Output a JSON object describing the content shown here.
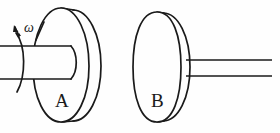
{
  "figure": {
    "background_color": "#fefefe",
    "line_color": "#1a1a1a",
    "width": 280,
    "height": 133
  },
  "labels": {
    "disk_a": "A",
    "disk_b": "B",
    "omega": "ω"
  },
  "diagram_data": {
    "type": "engineering-sketch",
    "description": "Side view line drawing of two circular disks. Disk A is mounted on a thick horizontal shaft entering from the left; a curved arrow labeled omega on the shaft indicates the angular velocity (spin direction) about the shaft axis. Disk B stands separate to the right and carries a thin horizontal shaft extending to the right edge.",
    "components": [
      {
        "name": "left-shaft",
        "kind": "cylinder",
        "label": "",
        "notes": "Thick shaft entering from the left image edge, ends inside disk A hub"
      },
      {
        "name": "omega-arrow",
        "kind": "rotation-arrow",
        "label": "ω",
        "notes": "Curved arrow around the left shaft, arrowhead pointing up and left"
      },
      {
        "name": "disk-a",
        "kind": "disk",
        "label": "A",
        "notes": "Large disk with visible rim thickness, mounted on the left shaft"
      },
      {
        "name": "disk-b",
        "kind": "disk",
        "label": "B",
        "notes": "Second disk with visible rim thickness, free-standing to the right of disk A"
      },
      {
        "name": "right-shaft",
        "kind": "cylinder",
        "label": "",
        "notes": "Thin shaft attached to the rim of disk B, extending to the right"
      }
    ]
  }
}
